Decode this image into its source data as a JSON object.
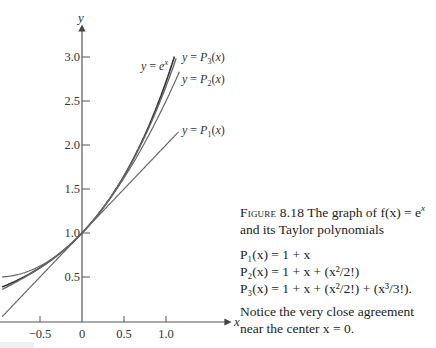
{
  "caption": {
    "figure_label": "Figure 8.18",
    "text_line1": "The graph of f(x) = e",
    "sup": "x",
    "text_line2": "and its Taylor polynomials",
    "equations": [
      "P₁(x) = 1 + x",
      "P₂(x) = 1 + x + (x²/2!)",
      "P₃(x) = 1 + x + (x²/2!) + (x³/3!)."
    ],
    "note_line1": "Notice the very close agreement",
    "note_line2": "near the center x = 0."
  },
  "chart_data": {
    "type": "line",
    "title": "",
    "xlabel": "x",
    "ylabel": "y",
    "xlim": [
      -0.95,
      1.4
    ],
    "ylim": [
      0,
      3.35
    ],
    "grid": false,
    "x_ticks": [
      "-0.5",
      "0",
      "0.5",
      "1.0"
    ],
    "y_ticks": [
      "0.5",
      "1.0",
      "1.5",
      "2.0",
      "2.5",
      "3.0"
    ],
    "series": [
      {
        "name": "y = e^x",
        "formula": "exp(x)",
        "x_range": [
          -0.95,
          1.1
        ]
      },
      {
        "name": "y = P3(x)",
        "formula": "1 + x + x^2/2 + x^3/6",
        "x_range": [
          -0.95,
          1.12
        ]
      },
      {
        "name": "y = P2(x)",
        "formula": "1 + x + x^2/2",
        "x_range": [
          -0.95,
          1.16
        ]
      },
      {
        "name": "y = P1(x)",
        "formula": "1 + x",
        "x_range": [
          -0.95,
          1.15
        ]
      }
    ],
    "annotations": [
      "y = e^x",
      "y = P3(x)",
      "y = P2(x)",
      "y = P1(x)"
    ]
  }
}
